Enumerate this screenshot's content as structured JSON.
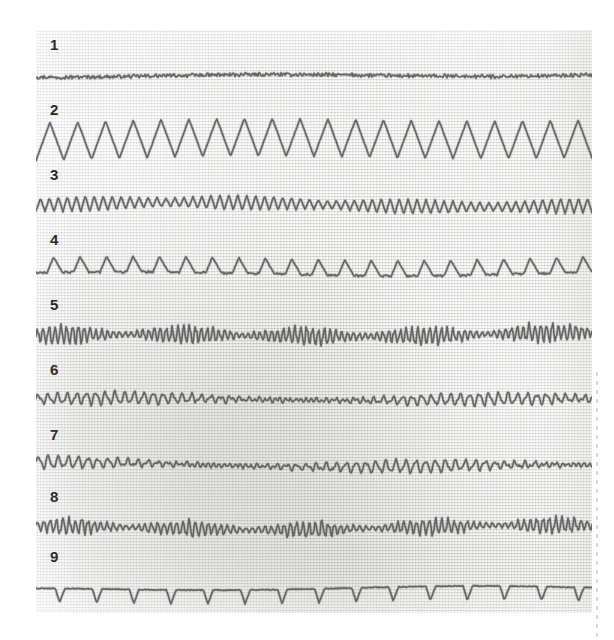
{
  "figure": {
    "kind": "scanned-waveform-chart",
    "background_color": "#e4e4e1",
    "ink_color": "#5c5c5c",
    "label_color": "#2b2b2b",
    "panel": {
      "x": 36,
      "y": 30,
      "width": 556,
      "height": 583
    }
  },
  "chart_data": {
    "type": "line",
    "title": "",
    "subtitle": "",
    "xlabel": "",
    "ylabel": "",
    "grid": false,
    "legend_position": "none",
    "x": {
      "label": "time",
      "range": [
        0,
        556
      ],
      "ticks": []
    },
    "y": {
      "label": "amplitude",
      "range": [
        -25,
        25
      ],
      "ticks": []
    },
    "trace_count": 9,
    "series": [
      {
        "name": "1",
        "label": "1",
        "waveform": "flat-noise",
        "description": "near-flat baseline with very low amplitude jitter",
        "amplitude": 1.5,
        "cycles": 150,
        "baseline": 0,
        "noise": 0.9,
        "row_top": 6
      },
      {
        "name": "2",
        "label": "2",
        "waveform": "triangle",
        "description": "large amplitude symmetric triangle / sawtooth wave",
        "amplitude": 19,
        "cycles": 20,
        "baseline": 2,
        "noise": 0.7,
        "row_top": 71
      },
      {
        "name": "3",
        "label": "3",
        "waveform": "triangle-modulated",
        "description": "high frequency sawtooth with slowly modulated amplitude",
        "amplitude": 8,
        "cycles": 62,
        "baseline": 0,
        "noise": 0.8,
        "row_top": 136
      },
      {
        "name": "4",
        "label": "4",
        "waveform": "pulse-peaks",
        "description": "rounded triangular peaks rising from a flat trough",
        "amplitude": 11,
        "cycles": 21,
        "baseline": 4,
        "noise": 0.7,
        "row_top": 201
      },
      {
        "name": "5",
        "label": "5",
        "waveform": "burst-noise",
        "description": "irregular high frequency noise with intermittent bursts",
        "amplitude": 8,
        "cycles": 95,
        "baseline": 0,
        "noise": 2.4,
        "row_top": 266
      },
      {
        "name": "6",
        "label": "6",
        "waveform": "irregular-medium",
        "description": "medium frequency irregular wave with drifting baseline",
        "amplitude": 5.5,
        "cycles": 58,
        "baseline": 0,
        "noise": 1.8,
        "row_top": 331
      },
      {
        "name": "7",
        "label": "7",
        "waveform": "irregular-medium",
        "description": "medium frequency irregular wave with drifting baseline",
        "amplitude": 5.5,
        "cycles": 56,
        "baseline": 0,
        "noise": 1.9,
        "row_top": 396
      },
      {
        "name": "8",
        "label": "8",
        "waveform": "burst-noise",
        "description": "low amplitude noise punctuated by higher frequency bursts",
        "amplitude": 7,
        "cycles": 88,
        "baseline": 0,
        "noise": 2.2,
        "row_top": 458
      },
      {
        "name": "9",
        "label": "9",
        "waveform": "negative-spikes",
        "description": "flat baseline interrupted by regular sharp downward spikes",
        "amplitude": 14,
        "cycles": 15,
        "baseline": -5,
        "noise": 0.8,
        "row_top": 518
      }
    ]
  },
  "labels": {
    "trace_1": "1",
    "trace_2": "2",
    "trace_3": "3",
    "trace_4": "4",
    "trace_5": "5",
    "trace_6": "6",
    "trace_7": "7",
    "trace_8": "8",
    "trace_9": "9"
  }
}
